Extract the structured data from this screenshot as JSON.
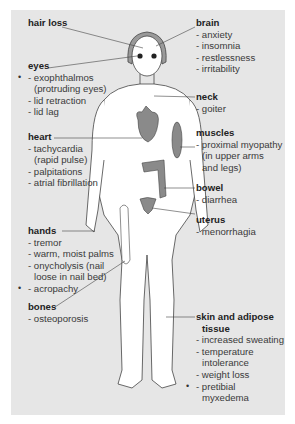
{
  "diagram": {
    "type": "anatomical figure with symptom callouts",
    "colors": {
      "panel": "#e6e6e6",
      "organ": "#8a8a8a",
      "line": "#444444"
    },
    "labels": {
      "hair_loss": {
        "title": "hair loss",
        "items": []
      },
      "eyes": {
        "title": "eyes",
        "items": [
          {
            "text": "- exophthalmos",
            "cont": "(protruding eyes)",
            "bullet": true
          },
          {
            "text": "- lid retraction"
          },
          {
            "text": "- lid lag"
          }
        ]
      },
      "heart": {
        "title": "heart",
        "items": [
          {
            "text": "- tachycardia",
            "cont": "(rapid pulse)"
          },
          {
            "text": "- palpitations"
          },
          {
            "text": "- atrial fibrillation"
          }
        ]
      },
      "hands": {
        "title": "hands",
        "items": [
          {
            "text": "- tremor"
          },
          {
            "text": "- warm, moist palms"
          },
          {
            "text": "- onycholysis (nail",
            "cont": "loose in nail bed)"
          },
          {
            "text": "- acropachy",
            "bullet": true
          }
        ]
      },
      "bones": {
        "title": "bones",
        "items": [
          {
            "text": "- osteoporosis"
          }
        ]
      },
      "brain": {
        "title": "brain",
        "items": [
          {
            "text": "- anxiety"
          },
          {
            "text": "- insomnia"
          },
          {
            "text": "- restlessness"
          },
          {
            "text": "- irritability"
          }
        ]
      },
      "neck": {
        "title": "neck",
        "items": [
          {
            "text": "- goiter"
          }
        ]
      },
      "muscles": {
        "title": "muscles",
        "items": [
          {
            "text": "- proximal myopathy",
            "cont": "(in upper arms",
            "cont2": "and legs)"
          }
        ]
      },
      "bowel": {
        "title": "bowel",
        "items": [
          {
            "text": "- diarrhea"
          }
        ]
      },
      "uterus": {
        "title": "uterus",
        "items": [
          {
            "text": "- menorrhagia"
          }
        ]
      },
      "skin": {
        "title": "skin and adipose",
        "title2": "tissue",
        "items": [
          {
            "text": "- increased sweating"
          },
          {
            "text": "- temperature",
            "cont": "intolerance"
          },
          {
            "text": "- weight loss"
          },
          {
            "text": "- pretibial",
            "cont": "myxedema",
            "bullet": true
          }
        ]
      }
    },
    "bullet_glyph": "•"
  }
}
